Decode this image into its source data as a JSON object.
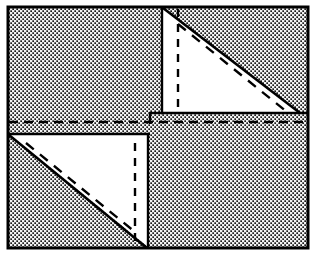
{
  "figure": {
    "type": "geometric-diagram",
    "canvas": {
      "width": 316,
      "height": 256
    },
    "colors": {
      "stroke": "#000000",
      "fill_white": "#ffffff",
      "stipple_dot": "#1a1a1a",
      "stipple_background": "#f2f2f2",
      "page_background": "#ffffff"
    },
    "frame": {
      "name": "outer-rectangle",
      "x": 8,
      "y": 7,
      "width": 300,
      "height": 241,
      "stroke_width": 3,
      "filled_with_stipple": true
    },
    "stipple": {
      "pattern": "halftone-dot-grid",
      "cell_size": 4,
      "dot_size": 1.7
    },
    "shapes": [
      {
        "name": "upper-right-triangle",
        "kind": "right-triangle",
        "fill": "white",
        "vertices": [
          [
            162,
            8
          ],
          [
            162,
            113
          ],
          [
            300,
            113
          ]
        ],
        "hypotenuse": {
          "from": [
            162,
            8
          ],
          "to": [
            300,
            113
          ]
        },
        "stroke_width": 2.4
      },
      {
        "name": "lower-left-triangle",
        "kind": "right-triangle",
        "fill": "white",
        "vertices": [
          [
            9,
            134
          ],
          [
            148,
            134
          ],
          [
            148,
            247
          ]
        ],
        "hypotenuse": {
          "from": [
            9,
            134
          ],
          "to": [
            148,
            247
          ]
        },
        "stroke_width": 2.4
      }
    ],
    "dashed_lines": [
      {
        "name": "median-horizontal-dashed-line",
        "orientation": "horizontal",
        "from": [
          9,
          122
        ],
        "to": [
          307,
          122
        ],
        "dash": "9 6",
        "stroke_width": 2.6
      },
      {
        "name": "upper-triangle-vertical-dashed-line",
        "orientation": "vertical",
        "from": [
          178,
          9
        ],
        "to": [
          178,
          112
        ],
        "dash": "8 7",
        "stroke_width": 2.4
      },
      {
        "name": "upper-triangle-diagonal-dashed-line",
        "orientation": "diagonal",
        "from": [
          178,
          24
        ],
        "to": [
          287,
          112
        ],
        "dash": "10 8",
        "stroke_width": 2.4
      },
      {
        "name": "lower-triangle-vertical-dashed-line",
        "orientation": "vertical",
        "from": [
          135,
          143
        ],
        "to": [
          135,
          246
        ],
        "dash": "8 7",
        "stroke_width": 2.4
      },
      {
        "name": "lower-triangle-diagonal-dashed-line",
        "orientation": "diagonal",
        "from": [
          26,
          143
        ],
        "to": [
          135,
          232
        ],
        "dash": "10 8",
        "stroke_width": 2.4
      }
    ],
    "center_notch": {
      "name": "center-step-notch",
      "description": "small rectangular step where the upper triangle base meets the lower triangle top edge",
      "vertical_segment": {
        "from": [
          150,
          113
        ],
        "to": [
          150,
          123
        ]
      },
      "horizontal_segment": {
        "from": [
          150,
          113
        ],
        "to": [
          163,
          113
        ]
      },
      "stroke_width": 2.4
    },
    "quadrant_edges": [
      {
        "name": "upper-quadrant-left-edge",
        "from": [
          162,
          8
        ],
        "to": [
          162,
          113
        ],
        "stroke_width": 2.4
      },
      {
        "name": "upper-quadrant-bottom-edge",
        "from": [
          162,
          113
        ],
        "to": [
          307,
          113
        ],
        "stroke_width": 2.4
      },
      {
        "name": "lower-quadrant-top-edge",
        "from": [
          9,
          134
        ],
        "to": [
          150,
          134
        ],
        "stroke_width": 2.4
      },
      {
        "name": "lower-quadrant-right-edge",
        "from": [
          148,
          134
        ],
        "to": [
          148,
          247
        ],
        "stroke_width": 2.4
      }
    ]
  }
}
